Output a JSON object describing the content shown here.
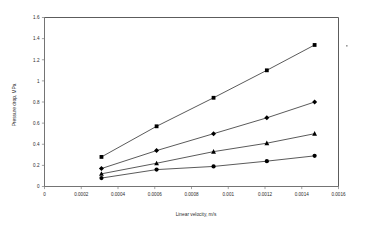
{
  "chart_data": {
    "type": "scatter",
    "title": "",
    "xlabel": "Linear velocity, m/s",
    "ylabel": "Pressure drop, MPa",
    "xlim": [
      0,
      0.0016
    ],
    "ylim": [
      0,
      1.6
    ],
    "grid": false,
    "legend": "none",
    "xticks": [
      "0",
      "0.0002",
      "0.0004",
      "0.0006",
      "0.0008",
      "0.001",
      "0.0012",
      "0.0014",
      "0.0016"
    ],
    "xtick_values": [
      0,
      0.0002,
      0.0004,
      0.0006,
      0.0008,
      0.001,
      0.0012,
      0.0014,
      0.0016
    ],
    "yticks": [
      "0",
      "0.2",
      "0.4",
      "0.6",
      "0.8",
      "1",
      "1.2",
      "1.4",
      "1.6"
    ],
    "ytick_values": [
      0,
      0.2,
      0.4,
      0.6,
      0.8,
      1,
      1.2,
      1.4,
      1.6
    ],
    "series": [
      {
        "name": "series-1",
        "marker": "square",
        "x": [
          0.00031,
          0.00061,
          0.00092,
          0.00121,
          0.00147
        ],
        "values": [
          0.28,
          0.57,
          0.84,
          1.1,
          1.34
        ]
      },
      {
        "name": "series-2",
        "marker": "diamond",
        "x": [
          0.00031,
          0.00061,
          0.00092,
          0.00121,
          0.00147
        ],
        "values": [
          0.17,
          0.34,
          0.5,
          0.65,
          0.8
        ]
      },
      {
        "name": "series-3",
        "marker": "triangle",
        "x": [
          0.00031,
          0.00061,
          0.00092,
          0.00121,
          0.00147
        ],
        "values": [
          0.12,
          0.22,
          0.33,
          0.41,
          0.5
        ]
      },
      {
        "name": "series-4",
        "marker": "circle",
        "x": [
          0.00031,
          0.00061,
          0.00092,
          0.00121,
          0.00147
        ],
        "values": [
          0.08,
          0.16,
          0.19,
          0.24,
          0.29
        ]
      }
    ]
  }
}
